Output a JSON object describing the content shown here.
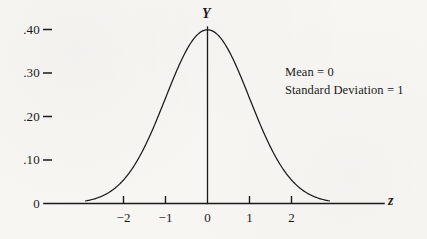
{
  "figure": {
    "background_color": "#f7f6f3",
    "ink_color": "#1a1a1a"
  },
  "annotation": {
    "mean_line": "Mean = 0",
    "sd_line": "Standard Deviation = 1"
  },
  "axes": {
    "y_axis_label": "Y",
    "x_axis_label": "z",
    "origin_label": "0"
  },
  "chart_data": {
    "type": "line",
    "title": "",
    "subtitle": "",
    "xlabel": "z",
    "ylabel": "Y",
    "grid": false,
    "legend": null,
    "annotations": [
      "Mean = 0",
      "Standard Deviation = 1"
    ],
    "distribution": "standard normal (Gaussian) probability density",
    "parameters": {
      "mean": 0,
      "standard_deviation": 1
    },
    "xlim": [
      -2.9,
      2.9
    ],
    "ylim": [
      0,
      0.42
    ],
    "xticks": [
      -2,
      -1,
      0,
      1,
      2
    ],
    "xtick_labels": [
      "−2",
      "−1",
      "0",
      "1",
      "2"
    ],
    "yticks": [
      0.1,
      0.2,
      0.3,
      0.4
    ],
    "ytick_labels": [
      ".10",
      ".20",
      ".30",
      ".40"
    ],
    "x": [
      -2.9,
      -2.7,
      -2.5,
      -2.3,
      -2.1,
      -1.9,
      -1.7,
      -1.5,
      -1.3,
      -1.1,
      -0.9,
      -0.7,
      -0.5,
      -0.3,
      -0.1,
      0,
      0.1,
      0.3,
      0.5,
      0.7,
      0.9,
      1.1,
      1.3,
      1.5,
      1.7,
      1.9,
      2.1,
      2.3,
      2.5,
      2.7,
      2.9
    ],
    "values": [
      0.006,
      0.0104,
      0.0175,
      0.0283,
      0.044,
      0.0656,
      0.094,
      0.1295,
      0.1714,
      0.2179,
      0.2661,
      0.3123,
      0.3521,
      0.3814,
      0.397,
      0.3989,
      0.397,
      0.3814,
      0.3521,
      0.3123,
      0.2661,
      0.2179,
      0.1714,
      0.1295,
      0.094,
      0.0656,
      0.044,
      0.0283,
      0.0175,
      0.0104,
      0.006
    ],
    "peak": {
      "x": 0,
      "y": 0.3989
    }
  }
}
